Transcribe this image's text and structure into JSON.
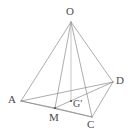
{
  "figure": {
    "background_color": "#ffffff",
    "line_color": "#8a8a8a",
    "label_color": "#4a4a4a",
    "width": 130,
    "height": 138,
    "points": [
      {
        "id": "O",
        "label": "O",
        "x": 71,
        "y": 22,
        "label_x": 66,
        "label_y": 6,
        "marker": false
      },
      {
        "id": "A",
        "label": "A",
        "x": 21,
        "y": 101,
        "label_x": 8,
        "label_y": 94,
        "marker": false
      },
      {
        "id": "D",
        "label": "D",
        "x": 113,
        "y": 82,
        "label_x": 116,
        "label_y": 75,
        "marker": false
      },
      {
        "id": "C",
        "label": "C",
        "x": 92,
        "y": 117,
        "label_x": 87,
        "label_y": 119,
        "marker": false
      },
      {
        "id": "M",
        "label": "M",
        "x": 55,
        "y": 108,
        "label_x": 49,
        "label_y": 112,
        "marker": true
      },
      {
        "id": "G'",
        "label": "G′",
        "x": 71,
        "y": 101,
        "label_x": 73,
        "label_y": 99,
        "marker": true
      }
    ],
    "edges": [
      {
        "from": "O",
        "to": "A",
        "style": "solid"
      },
      {
        "from": "O",
        "to": "D",
        "style": "solid"
      },
      {
        "from": "O",
        "to": "C",
        "style": "solid"
      },
      {
        "from": "O",
        "to": "M",
        "style": "solid"
      },
      {
        "from": "O",
        "to": "G'",
        "style": "light"
      },
      {
        "from": "A",
        "to": "D",
        "style": "solid"
      },
      {
        "from": "A",
        "to": "M",
        "style": "solid"
      },
      {
        "from": "A",
        "to": "C",
        "style": "solid"
      },
      {
        "from": "M",
        "to": "C",
        "style": "solid"
      },
      {
        "from": "M",
        "to": "D",
        "style": "solid"
      },
      {
        "from": "C",
        "to": "D",
        "style": "solid"
      }
    ]
  }
}
